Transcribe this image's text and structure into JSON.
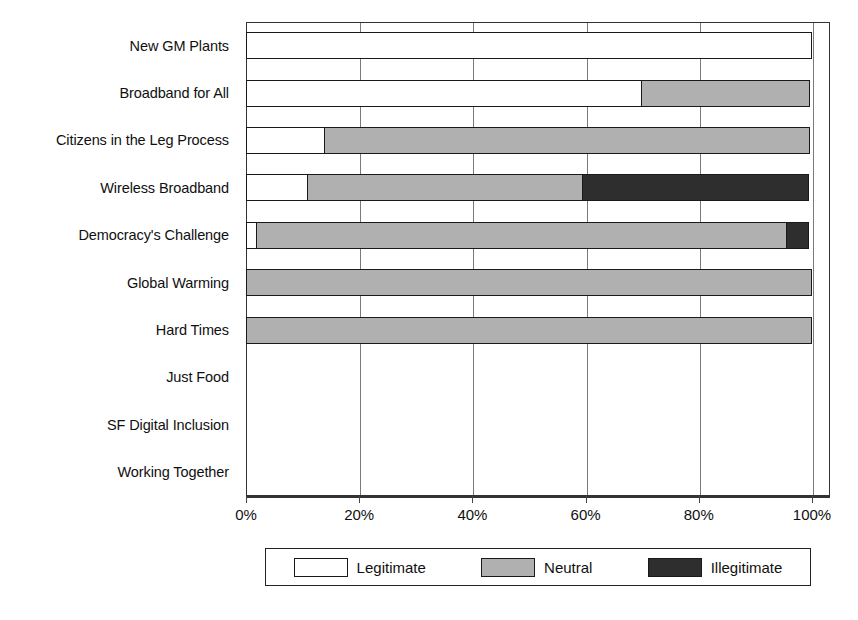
{
  "chart_data": {
    "type": "bar",
    "orientation": "horizontal",
    "stacked": true,
    "normalized": true,
    "title": "",
    "xlabel": "",
    "ylabel": "",
    "xlim": [
      0,
      100
    ],
    "grid": true,
    "legend_position": "bottom",
    "categories": [
      "New GM Plants",
      "Broadband for All",
      "Citizens in the Leg Process",
      "Wireless Broadband",
      "Democracy's Challenge",
      "Global Warming",
      "Hard Times",
      "Just Food",
      "SF Digital Inclusion",
      "Working Together"
    ],
    "series": [
      {
        "name": "Legitimate",
        "color": "#ffffff",
        "values": [
          100,
          70,
          14,
          11,
          2,
          0,
          0,
          null,
          null,
          null
        ]
      },
      {
        "name": "Neutral",
        "color": "#b0b0b0",
        "values": [
          0,
          30,
          86,
          49,
          94,
          100,
          100,
          null,
          null,
          null
        ]
      },
      {
        "name": "Illegitimate",
        "color": "#2e2e2e",
        "values": [
          0,
          0,
          0,
          40,
          4,
          0,
          0,
          null,
          null,
          null
        ]
      }
    ],
    "xticks": [
      0,
      20,
      40,
      60,
      80,
      100
    ],
    "xticklabels": [
      "0%",
      "20%",
      "40%",
      "60%",
      "80%",
      "100%"
    ]
  },
  "legend": {
    "items": [
      {
        "label": "Legitimate",
        "key": "legitimate"
      },
      {
        "label": "Neutral",
        "key": "neutral"
      },
      {
        "label": "Illegitimate",
        "key": "illegitimate"
      }
    ]
  }
}
